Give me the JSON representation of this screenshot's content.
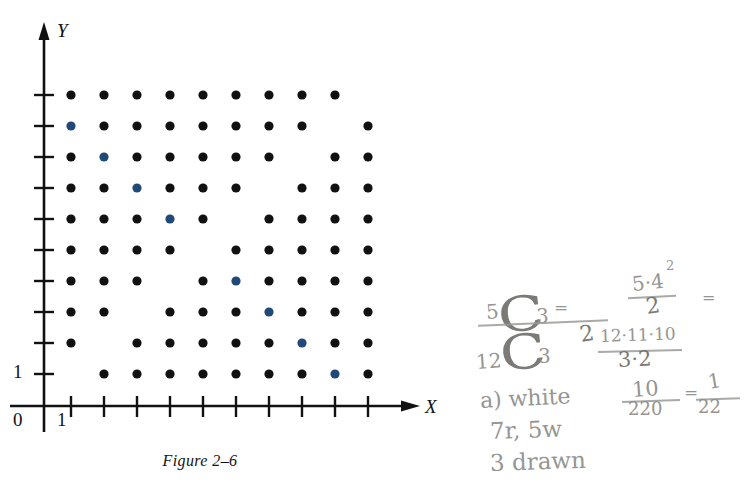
{
  "figure": {
    "caption": "Figure 2–6",
    "x_axis_label": "X",
    "y_axis_label": "Y",
    "origin_label": "0",
    "x_first_tick_label": "1",
    "y_first_tick_label": "1",
    "dot_color_black": "#111111",
    "dot_color_blue": "#20497a",
    "axis_color": "#111111"
  },
  "chart_data": {
    "type": "scatter",
    "title": "Figure 2–6",
    "xlabel": "X",
    "ylabel": "Y",
    "xlim": [
      0,
      11
    ],
    "ylim": [
      0,
      11
    ],
    "grid": false,
    "legend": "none",
    "xticks": [
      1,
      2,
      3,
      4,
      5,
      6,
      7,
      8,
      9,
      10
    ],
    "yticks": [
      1,
      2,
      3,
      4,
      5,
      6,
      7,
      8,
      9,
      10
    ],
    "xticklabels": [
      "1",
      "",
      "",
      "",
      "",
      "",
      "",
      "",
      "",
      ""
    ],
    "yticklabels": [
      "1",
      "",
      "",
      "",
      "",
      "",
      "",
      "",
      "",
      ""
    ],
    "series": [
      {
        "name": "sample-points",
        "color": "#111111",
        "marker": "filled-circle",
        "points": [
          [
            1,
            10
          ],
          [
            2,
            10
          ],
          [
            3,
            10
          ],
          [
            4,
            10
          ],
          [
            5,
            10
          ],
          [
            6,
            10
          ],
          [
            7,
            10
          ],
          [
            8,
            10
          ],
          [
            9,
            10
          ],
          [
            2,
            9
          ],
          [
            3,
            9
          ],
          [
            4,
            9
          ],
          [
            5,
            9
          ],
          [
            6,
            9
          ],
          [
            7,
            9
          ],
          [
            8,
            9
          ],
          [
            10,
            9
          ],
          [
            1,
            8
          ],
          [
            3,
            8
          ],
          [
            4,
            8
          ],
          [
            5,
            8
          ],
          [
            6,
            8
          ],
          [
            7,
            8
          ],
          [
            9,
            8
          ],
          [
            10,
            8
          ],
          [
            1,
            7
          ],
          [
            2,
            7
          ],
          [
            4,
            7
          ],
          [
            5,
            7
          ],
          [
            6,
            7
          ],
          [
            8,
            7
          ],
          [
            9,
            7
          ],
          [
            10,
            7
          ],
          [
            1,
            6
          ],
          [
            2,
            6
          ],
          [
            3,
            6
          ],
          [
            5,
            6
          ],
          [
            7,
            6
          ],
          [
            8,
            6
          ],
          [
            9,
            6
          ],
          [
            10,
            6
          ],
          [
            1,
            5
          ],
          [
            2,
            5
          ],
          [
            3,
            5
          ],
          [
            4,
            5
          ],
          [
            6,
            5
          ],
          [
            7,
            5
          ],
          [
            8,
            5
          ],
          [
            9,
            5
          ],
          [
            10,
            5
          ],
          [
            1,
            4
          ],
          [
            2,
            4
          ],
          [
            3,
            4
          ],
          [
            5,
            4
          ],
          [
            7,
            4
          ],
          [
            8,
            4
          ],
          [
            9,
            4
          ],
          [
            10,
            4
          ],
          [
            1,
            3
          ],
          [
            2,
            3
          ],
          [
            4,
            3
          ],
          [
            5,
            3
          ],
          [
            6,
            3
          ],
          [
            8,
            3
          ],
          [
            9,
            3
          ],
          [
            10,
            3
          ],
          [
            1,
            2
          ],
          [
            3,
            2
          ],
          [
            4,
            2
          ],
          [
            5,
            2
          ],
          [
            6,
            2
          ],
          [
            7,
            2
          ],
          [
            9,
            2
          ],
          [
            10,
            2
          ],
          [
            2,
            1
          ],
          [
            3,
            1
          ],
          [
            4,
            1
          ],
          [
            5,
            1
          ],
          [
            6,
            1
          ],
          [
            7,
            1
          ],
          [
            8,
            1
          ],
          [
            10,
            1
          ]
        ]
      },
      {
        "name": "diagonal-points",
        "color": "#20497a",
        "marker": "filled-circle",
        "points": [
          [
            1,
            9
          ],
          [
            2,
            8
          ],
          [
            3,
            7
          ],
          [
            4,
            6
          ],
          [
            6,
            4
          ],
          [
            7,
            3
          ],
          [
            8,
            2
          ],
          [
            9,
            1
          ]
        ]
      }
    ],
    "missing_points": [
      [
        10,
        10
      ],
      [
        9,
        9
      ],
      [
        8,
        8
      ],
      [
        7,
        7
      ],
      [
        6,
        6
      ],
      [
        5,
        5
      ],
      [
        4,
        4
      ],
      [
        3,
        3
      ],
      [
        2,
        2
      ],
      [
        1,
        1
      ]
    ]
  },
  "handwriting": {
    "lines": [
      {
        "id": "numerator",
        "text": "C",
        "sub": "3",
        "pre": "5"
      },
      {
        "id": "denominator",
        "text": "C",
        "sub": "3",
        "pre": "12"
      },
      {
        "id": "frac-num-top",
        "text": "5·4"
      },
      {
        "id": "frac-num-exp",
        "text": "2"
      },
      {
        "id": "frac-num-bot",
        "text": "2"
      },
      {
        "id": "equals-1",
        "text": "="
      },
      {
        "id": "equals-2",
        "text": "="
      },
      {
        "id": "denom-expr",
        "text": "12·11·10"
      },
      {
        "id": "denom-strike",
        "text": "2"
      },
      {
        "id": "denom-div",
        "text": "3·2"
      },
      {
        "id": "answer-a",
        "text": "a) white"
      },
      {
        "id": "answer-frac-num",
        "text": "10"
      },
      {
        "id": "answer-frac-den",
        "text": "220"
      },
      {
        "id": "answer-eq",
        "text": "="
      },
      {
        "id": "answer-res-num",
        "text": "1"
      },
      {
        "id": "answer-res-den",
        "text": "22"
      },
      {
        "id": "given-balls",
        "text": "7r, 5w"
      },
      {
        "id": "given-draw",
        "text": "3 drawn"
      }
    ]
  }
}
